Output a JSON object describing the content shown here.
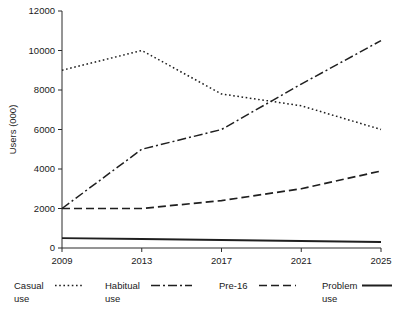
{
  "chart_data": {
    "type": "line",
    "title": "",
    "subtitle": "",
    "xlabel": "",
    "ylabel": "Users (000)",
    "x": [
      2009,
      2013,
      2017,
      2021,
      2025
    ],
    "categories": [
      "2009",
      "2013",
      "2017",
      "2021",
      "2025"
    ],
    "xlim": [
      2009,
      2025
    ],
    "ylim": [
      0,
      12000
    ],
    "yticks": [
      0,
      2000,
      4000,
      6000,
      8000,
      10000,
      12000
    ],
    "ytick_labels": [
      "0",
      "2000",
      "4000",
      "6000",
      "8000",
      "10000",
      "12000"
    ],
    "xtick_labels": [
      "2009",
      "2013",
      "2017",
      "2021",
      "2025"
    ],
    "grid": false,
    "legend_position": "bottom",
    "series": [
      {
        "name": "Casual use",
        "label_line1": "Casual",
        "label_line2": "use",
        "style": "dotted",
        "dash": "1.6 2.6",
        "width": 1.5,
        "color": "#1f1f1f",
        "values": [
          9000,
          10000,
          7800,
          7200,
          6000
        ]
      },
      {
        "name": "Habitual use",
        "label_line1": "Habitual",
        "label_line2": "use",
        "style": "dash-dot",
        "dash": "9 3 2 3",
        "width": 1.5,
        "color": "#1f1f1f",
        "values": [
          2000,
          5000,
          6000,
          8300,
          10500
        ]
      },
      {
        "name": "Pre-16",
        "label_line1": "Pre-16",
        "label_line2": "",
        "style": "dashed",
        "dash": "8 4",
        "width": 1.7,
        "color": "#1f1f1f",
        "values": [
          2000,
          2000,
          2400,
          3000,
          3900
        ]
      },
      {
        "name": "Problem use",
        "label_line1": "Problem",
        "label_line2": "use",
        "style": "solid",
        "dash": "none",
        "width": 2.0,
        "color": "#1f1f1f",
        "values": [
          500,
          450,
          400,
          350,
          300
        ]
      }
    ]
  },
  "legend": {
    "items": [
      {
        "line1": "Casual",
        "line2": "use",
        "dash": "1.6 2.6",
        "width": 1.5
      },
      {
        "line1": "Habitual",
        "line2": "use",
        "dash": "9 3 2 3",
        "width": 1.5
      },
      {
        "line1": "Pre-16",
        "line2": "",
        "dash": "8 4",
        "width": 1.7
      },
      {
        "line1": "Problem",
        "line2": "use",
        "dash": "none",
        "width": 2.0
      }
    ]
  },
  "axes": {
    "y_title": "Users (000)"
  }
}
